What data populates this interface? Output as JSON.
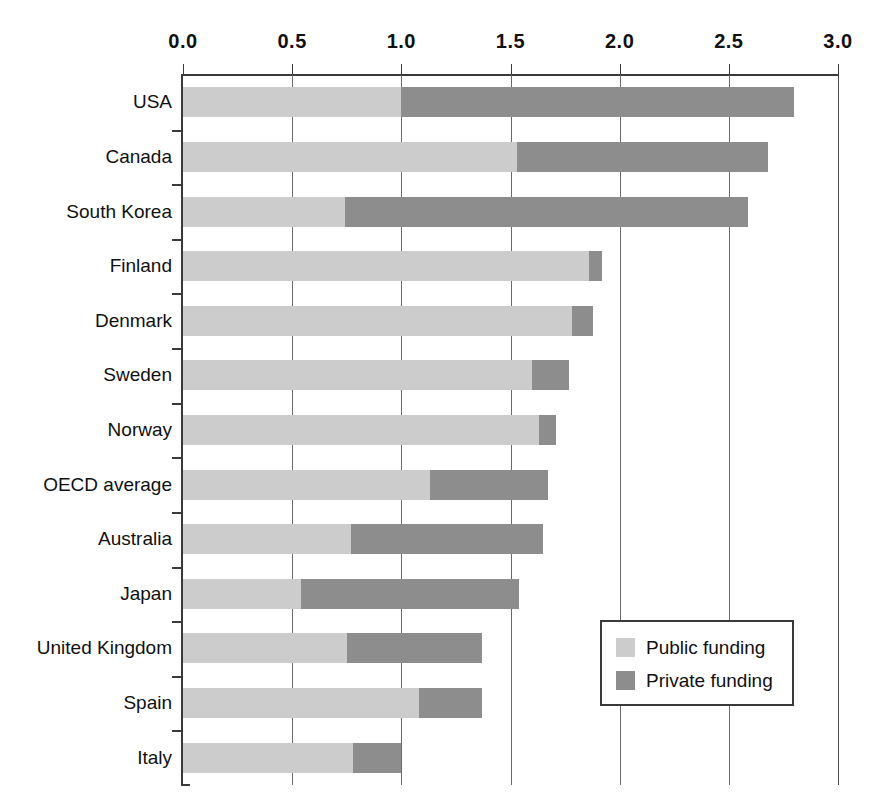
{
  "chart_data": {
    "type": "bar",
    "orientation": "horizontal",
    "stacked": true,
    "title": "",
    "subtitle": "",
    "xlabel": "",
    "ylabel": "",
    "xlim": [
      0.0,
      3.0
    ],
    "grid": true,
    "legend_position": "inside-bottom-right",
    "xticks": [
      "0.0",
      "0.5",
      "1.0",
      "1.5",
      "2.0",
      "2.5",
      "3.0"
    ],
    "xtick_values": [
      0.0,
      0.5,
      1.0,
      1.5,
      2.0,
      2.5,
      3.0
    ],
    "categories": [
      "USA",
      "Canada",
      "South Korea",
      "Finland",
      "Denmark",
      "Sweden",
      "Norway",
      "OECD average",
      "Australia",
      "Japan",
      "United Kingdom",
      "Spain",
      "Italy"
    ],
    "series": [
      {
        "name": "Public funding",
        "color": "#cccccc",
        "values": [
          1.0,
          1.53,
          0.74,
          1.86,
          1.78,
          1.6,
          1.63,
          1.13,
          0.77,
          0.54,
          0.75,
          1.08,
          0.78
        ]
      },
      {
        "name": "Private funding",
        "color": "#8d8d8d",
        "values": [
          1.8,
          1.15,
          1.85,
          0.06,
          0.1,
          0.17,
          0.08,
          0.54,
          0.88,
          1.0,
          0.62,
          0.29,
          0.22
        ]
      }
    ],
    "totals": [
      2.8,
      2.68,
      2.59,
      1.92,
      1.88,
      1.77,
      1.71,
      1.67,
      1.65,
      1.54,
      1.37,
      1.37,
      1.0
    ]
  },
  "legend": {
    "items": [
      {
        "label": "Public funding",
        "color": "#cccccc"
      },
      {
        "label": "Private funding",
        "color": "#8d8d8d"
      }
    ]
  },
  "colors": {
    "public": "#cccccc",
    "private": "#8d8d8d",
    "axis": "#3a3a3a",
    "grid": "#6a6a6a",
    "background": "#ffffff"
  }
}
